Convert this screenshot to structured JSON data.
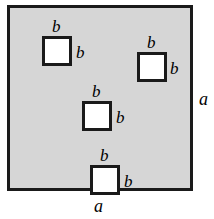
{
  "figure": {
    "colors": {
      "outer_fill": "#d6d6d6",
      "inner_fill": "#ffffff",
      "stroke": "#1a1a1a",
      "background": "#ffffff"
    },
    "outer_square": {
      "side_label": "a",
      "side_label_right": "a",
      "side_label_bottom": "a"
    },
    "inner_squares": [
      {
        "id": 1,
        "top_label": "b",
        "right_label": "b"
      },
      {
        "id": 2,
        "top_label": "b",
        "right_label": "b"
      },
      {
        "id": 3,
        "top_label": "b",
        "right_label": "b"
      },
      {
        "id": 4,
        "top_label": "b",
        "right_label": "b"
      }
    ]
  }
}
